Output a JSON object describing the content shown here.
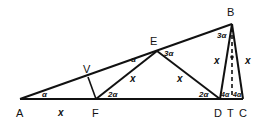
{
  "diagram": {
    "stroke_color": "#111111",
    "background": "#ffffff",
    "points": {
      "A": {
        "label": "A"
      },
      "F": {
        "label": "F"
      },
      "D": {
        "label": "D"
      },
      "T": {
        "label": "T"
      },
      "C": {
        "label": "C"
      },
      "B": {
        "label": "B"
      },
      "E": {
        "label": "E"
      },
      "V": {
        "label": "V"
      }
    },
    "angles": {
      "A": "α",
      "E_left": "α",
      "F": "2α",
      "E_right": "3α",
      "D": "2α",
      "B": "3α",
      "DT": "4α",
      "TC": "4α"
    },
    "lengths": {
      "AF": "x",
      "FE": "x",
      "ED": "x",
      "BD": "x",
      "BC": "x"
    }
  }
}
